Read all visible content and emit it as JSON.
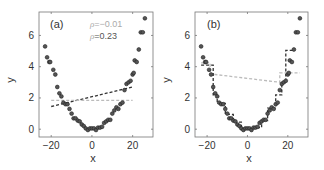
{
  "chart_data": [
    {
      "type": "scatter",
      "panel_label": "(a)",
      "title": "",
      "xlabel": "x",
      "ylabel": "y",
      "xlim": [
        -26,
        30
      ],
      "ylim": [
        -0.5,
        7.5
      ],
      "xticks": [
        -20,
        0,
        20
      ],
      "yticks": [
        0,
        2,
        4,
        6
      ],
      "grid": false,
      "annotations": [
        {
          "text_symbol": "ρ",
          "text_value": "=−0.01",
          "color": "#aaaaaa"
        },
        {
          "text_symbol": "ρ",
          "text_value": "=0.23",
          "color": "#555555"
        }
      ],
      "x": [
        -23,
        -22,
        -21,
        -20.5,
        -19,
        -18,
        -17,
        -16,
        -15,
        -14,
        -13,
        -12,
        -11,
        -10,
        -9,
        -8,
        -7,
        -6,
        -5,
        -4,
        -3,
        -2,
        -1,
        0,
        1,
        2,
        3,
        4,
        5,
        6,
        7,
        8,
        9,
        10,
        11,
        12,
        13,
        14,
        15,
        16,
        17,
        18,
        19,
        20,
        20.5,
        21,
        22,
        23,
        24,
        25,
        26
      ],
      "y": [
        5.3,
        4.6,
        4.3,
        4.3,
        3.8,
        3.5,
        2.7,
        2.3,
        2.1,
        1.7,
        1.6,
        1.6,
        1.3,
        1.0,
        0.7,
        0.7,
        0.55,
        0.5,
        0.3,
        0.2,
        0.05,
        -0.05,
        0.05,
        0.05,
        0.05,
        -0.05,
        0.1,
        0.1,
        0.15,
        0.4,
        0.5,
        0.6,
        0.6,
        1.0,
        1.2,
        1.4,
        1.3,
        1.6,
        1.7,
        2.5,
        2.9,
        3.0,
        3.1,
        3.5,
        3.6,
        4.4,
        4.3,
        5.1,
        6.2,
        6.2,
        7.1
      ],
      "lines": [
        {
          "name": "linear fit",
          "style": "dashed",
          "color": "#333333",
          "x": [
            -20,
            20
          ],
          "y": [
            1.45,
            2.7
          ]
        },
        {
          "name": "mean",
          "style": "dashed",
          "color": "#bbbbbb",
          "x": [
            -20,
            20
          ],
          "y": [
            1.85,
            1.85
          ]
        }
      ]
    },
    {
      "type": "scatter",
      "panel_label": "(b)",
      "title": "",
      "xlabel": "x",
      "ylabel": "y",
      "xlim": [
        -26,
        30
      ],
      "ylim": [
        -0.5,
        7.5
      ],
      "xticks": [
        -20,
        0,
        20
      ],
      "yticks": [
        0,
        2,
        4,
        6
      ],
      "grid": false,
      "x": [
        -23,
        -22,
        -21,
        -20.5,
        -19,
        -18,
        -17,
        -16,
        -15,
        -14,
        -13,
        -12,
        -11,
        -10,
        -9,
        -8,
        -7,
        -6,
        -5,
        -4,
        -3,
        -2,
        -1,
        0,
        1,
        2,
        3,
        4,
        5,
        6,
        7,
        8,
        9,
        10,
        11,
        12,
        13,
        14,
        15,
        16,
        17,
        18,
        19,
        20,
        20.5,
        21,
        22,
        23,
        24,
        25,
        26
      ],
      "y": [
        5.3,
        4.6,
        4.3,
        4.3,
        3.8,
        3.5,
        2.7,
        2.3,
        2.1,
        1.7,
        1.6,
        1.6,
        1.3,
        1.0,
        0.7,
        0.7,
        0.55,
        0.5,
        0.3,
        0.2,
        0.05,
        -0.05,
        0.05,
        0.05,
        0.05,
        -0.05,
        0.1,
        0.1,
        0.15,
        0.4,
        0.5,
        0.6,
        0.6,
        1.0,
        1.2,
        1.4,
        1.3,
        1.6,
        1.7,
        2.5,
        2.9,
        3.0,
        3.1,
        3.5,
        3.6,
        4.4,
        4.3,
        5.1,
        6.2,
        6.2,
        7.1
      ],
      "lines": [
        {
          "name": "step fit",
          "style": "dashed",
          "color": "#333333",
          "x": [
            -23,
            -17,
            -17,
            -15,
            -15,
            -11,
            -11,
            -7,
            -7,
            -3,
            -3,
            3,
            3,
            7,
            7,
            10,
            10,
            14,
            14,
            17,
            17,
            19,
            19,
            23.5
          ],
          "y": [
            4.1,
            4.1,
            2.2,
            2.2,
            1.65,
            1.65,
            0.95,
            0.95,
            0.45,
            0.45,
            0.05,
            0.05,
            0.1,
            0.1,
            0.55,
            0.55,
            1.35,
            1.35,
            2.2,
            2.2,
            3.0,
            3.0,
            5.05,
            5.05
          ]
        },
        {
          "name": "step fit alt",
          "style": "dashed",
          "color": "#bbbbbb",
          "x": [
            -23,
            -18.5,
            -18.5,
            -16,
            16,
            16,
            26
          ],
          "y": [
            4.25,
            4.25,
            3.5,
            3.5,
            3.0,
            3.6,
            3.6
          ]
        }
      ]
    }
  ],
  "panels": [
    {
      "label": "(a)",
      "xlabel": "x",
      "ylabel": "y",
      "xtick_labels": [
        "−20",
        "0",
        "20"
      ],
      "ytick_labels": [
        "0",
        "2",
        "4",
        "6"
      ],
      "rho1_sym": "ρ",
      "rho1_val": "=−0.01",
      "rho2_sym": "ρ",
      "rho2_val": "=0.23"
    },
    {
      "label": "(b)",
      "xlabel": "x",
      "ylabel": "y",
      "xtick_labels": [
        "−20",
        "0",
        "20"
      ],
      "ytick_labels": [
        "0",
        "2",
        "4",
        "6"
      ]
    }
  ],
  "colors": {
    "points": "#3a3a3a",
    "axis": "#666666",
    "fit_dark": "#333333",
    "fit_light": "#bbbbbb"
  }
}
